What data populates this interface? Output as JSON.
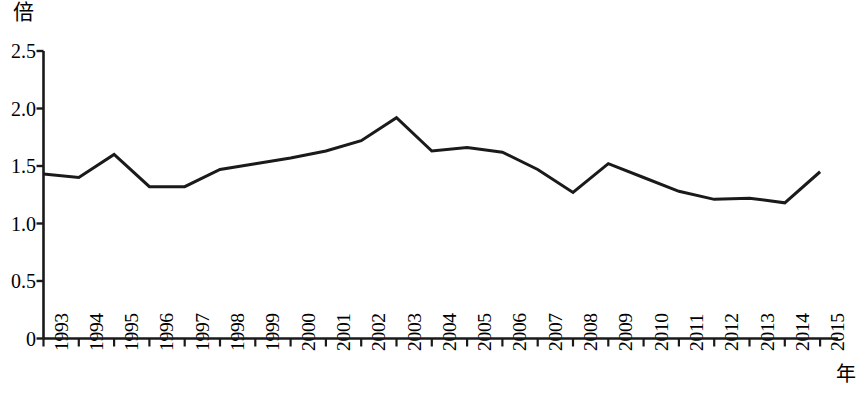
{
  "chart_data": {
    "type": "line",
    "title": "",
    "subtitle": "",
    "xlabel": "年",
    "ylabel": "倍",
    "unit_label": "倍",
    "x_axis_unit_label": "年",
    "categories": [
      "1993",
      "1994",
      "1995",
      "1996",
      "1997",
      "1998",
      "1999",
      "2000",
      "2001",
      "2002",
      "2003",
      "2004",
      "2005",
      "2006",
      "2007",
      "2008",
      "2009",
      "2010",
      "2011",
      "2012",
      "2013",
      "2014",
      "2015"
    ],
    "values": [
      1.43,
      1.4,
      1.6,
      1.32,
      1.32,
      1.47,
      1.52,
      1.57,
      1.63,
      1.72,
      1.92,
      1.63,
      1.66,
      1.62,
      1.47,
      1.27,
      1.52,
      1.4,
      1.28,
      1.21,
      1.22,
      1.18,
      1.45
    ],
    "series": [
      {
        "name": "",
        "values": [
          1.43,
          1.4,
          1.6,
          1.32,
          1.32,
          1.47,
          1.52,
          1.57,
          1.63,
          1.72,
          1.92,
          1.63,
          1.66,
          1.62,
          1.47,
          1.27,
          1.52,
          1.4,
          1.28,
          1.21,
          1.22,
          1.18,
          1.45
        ],
        "color": "#1a1a1a"
      }
    ],
    "ylim": [
      0,
      2.5
    ],
    "y_ticks": [
      0,
      0.5,
      1.0,
      1.5,
      2.0,
      2.5
    ],
    "y_tick_labels": [
      "0",
      "0.5",
      "1.0",
      "1.5",
      "2.0",
      "2.5"
    ],
    "x_tick_labels": [
      "1993",
      "1994",
      "1995",
      "1996",
      "1997",
      "1998",
      "1999",
      "2000",
      "2001",
      "2002",
      "2003",
      "2004",
      "2005",
      "2006",
      "2007",
      "2008",
      "2009",
      "2010",
      "2011",
      "2012",
      "2013",
      "2014",
      "2015"
    ],
    "grid": false,
    "legend": false,
    "legend_position": "none",
    "line_color": "#1a1a1a",
    "line_width": 3,
    "markers": false,
    "background_color": "#ffffff",
    "axis_color": "#1a1a1a"
  }
}
